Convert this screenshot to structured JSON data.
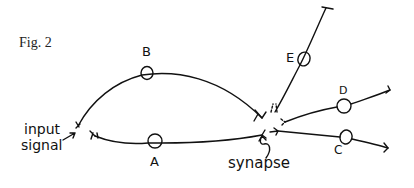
{
  "figure": {
    "title": "Fig. 2",
    "input_label_line1": "input",
    "input_label_line2": "signal",
    "synapse_label": "synapse"
  },
  "nodes": [
    {
      "id": "A",
      "label": "A"
    },
    {
      "id": "B",
      "label": "B"
    },
    {
      "id": "C",
      "label": "C"
    },
    {
      "id": "D",
      "label": "D"
    },
    {
      "id": "E",
      "label": "E"
    }
  ],
  "colors": {
    "ink": "#111111",
    "background": "#ffffff"
  }
}
